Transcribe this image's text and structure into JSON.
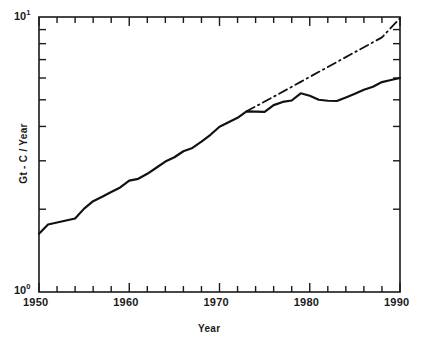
{
  "chart_data": {
    "type": "line",
    "title": "",
    "subtitle": "",
    "xlabel": "Year",
    "ylabel": "Gt - C / Year",
    "xlim": [
      1950,
      1990
    ],
    "ylim": [
      1,
      10
    ],
    "yscale": "log",
    "xscale": "linear",
    "grid": false,
    "legend": null,
    "xticks": [
      1950,
      1955,
      1960,
      1965,
      1970,
      1975,
      1980,
      1985,
      1990
    ],
    "xtick_labels": [
      "1950",
      "",
      "1960",
      "",
      "1970",
      "",
      "1980",
      "",
      "1990"
    ],
    "xtick_major_labels": [
      "1950",
      "1960",
      "1970",
      "1980",
      "1990"
    ],
    "xtick_minor_interval": 2,
    "ytick_labels": [
      "10⁰",
      "10¹"
    ],
    "ytick_major": [
      1,
      10
    ],
    "ytick_minor": [
      2,
      3,
      4,
      5,
      6,
      7,
      8,
      9
    ],
    "series": [
      {
        "name": "Observed emissions",
        "style": "solid",
        "color": "#111111",
        "x": [
          1950,
          1951,
          1952,
          1953,
          1954,
          1955,
          1956,
          1957,
          1958,
          1959,
          1960,
          1961,
          1962,
          1963,
          1964,
          1965,
          1966,
          1967,
          1968,
          1969,
          1970,
          1971,
          1972,
          1973,
          1974,
          1975,
          1976,
          1977,
          1978,
          1979,
          1980,
          1981,
          1982,
          1983,
          1984,
          1985,
          1986,
          1987,
          1988,
          1989,
          1990
        ],
        "y": [
          1.63,
          1.76,
          1.79,
          1.82,
          1.85,
          2.01,
          2.14,
          2.22,
          2.31,
          2.4,
          2.54,
          2.58,
          2.69,
          2.83,
          2.98,
          3.09,
          3.25,
          3.34,
          3.52,
          3.73,
          3.99,
          4.14,
          4.3,
          4.54,
          4.53,
          4.52,
          4.78,
          4.91,
          4.97,
          5.28,
          5.17,
          5.0,
          4.96,
          4.95,
          5.1,
          5.26,
          5.44,
          5.58,
          5.8,
          5.9,
          6.0
        ]
      },
      {
        "name": "Exponential extrapolation",
        "style": "dash-dot",
        "color": "#111111",
        "x": [
          1973,
          1976,
          1979,
          1982,
          1985,
          1988,
          1990
        ],
        "y": [
          4.54,
          5.13,
          5.81,
          6.58,
          7.45,
          8.43,
          9.9
        ]
      }
    ]
  },
  "axes": {
    "y_top_label_base": "10",
    "y_top_label_exp": "1",
    "y_bottom_label_base": "10",
    "y_bottom_label_exp": "0"
  }
}
